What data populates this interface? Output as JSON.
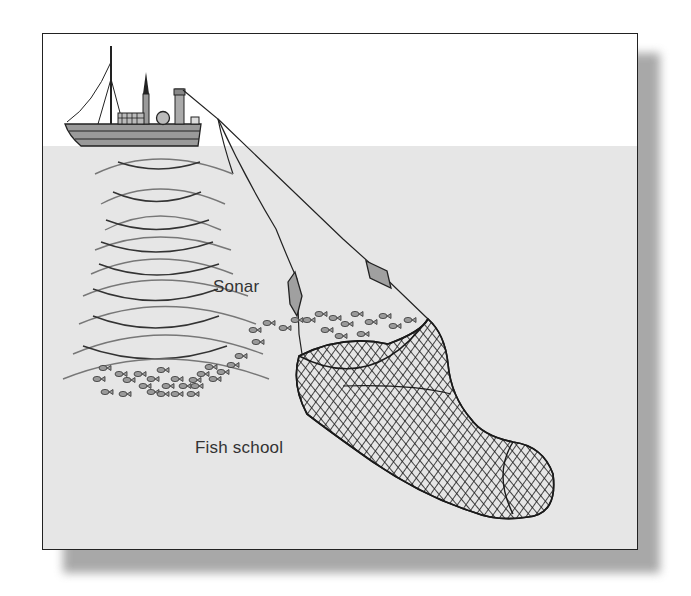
{
  "diagram": {
    "type": "illustration",
    "labels": {
      "sonar": "Sonar",
      "fish_school": "Fish school"
    },
    "colors": {
      "sky": "#ffffff",
      "water": "#e6e6e6",
      "line": "#222222",
      "hull": "#9a9a9a",
      "otter_board": "#a0a0a0"
    },
    "elements": [
      "ship",
      "sonar-waves",
      "tow-cables",
      "otter-boards",
      "fish-school",
      "trawl-net"
    ]
  }
}
